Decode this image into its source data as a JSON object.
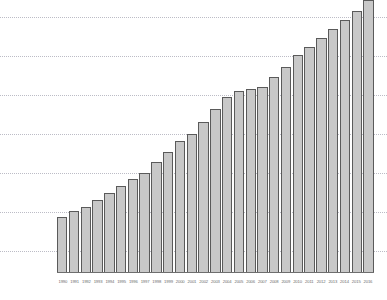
{
  "chart_data": {
    "type": "bar",
    "title": "",
    "subtitle": "",
    "xlabel": "",
    "ylabel": "",
    "legend": [],
    "grid": true,
    "gridlines_y": [
      17,
      56,
      95,
      134,
      173,
      212,
      251
    ],
    "baseline_y": 272,
    "ylim": [
      0,
      300
    ],
    "categories": [
      "1990",
      "1991",
      "1992",
      "1993",
      "1994",
      "1995",
      "1996",
      "1997",
      "1998",
      "1999",
      "2000",
      "2001",
      "2002",
      "2003",
      "2004",
      "2005",
      "2006",
      "2007",
      "2008",
      "2009",
      "2010",
      "2011",
      "2012",
      "2013",
      "2014",
      "2015",
      "2016"
    ],
    "values": [
      62,
      68,
      73,
      80,
      88,
      96,
      103,
      110,
      122,
      133,
      145,
      153,
      166,
      180,
      193,
      200,
      202,
      204,
      215,
      226,
      240,
      248,
      258,
      268,
      278,
      288,
      300
    ],
    "bar_fill": "#c8c8c8",
    "bar_stroke": "#5a5a5a",
    "gridline_color": "#b9b9c4",
    "axis_color": "#6e6e6e",
    "label_color": "#6d6d6d"
  }
}
